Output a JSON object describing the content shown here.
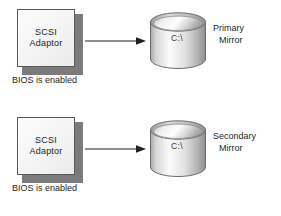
{
  "diagram": {
    "background_color": "#ffffff",
    "text_color": "#231f20",
    "groups": [
      {
        "id": "primary",
        "adaptor": {
          "line1": "SCSI",
          "line2": "Adaptor",
          "caption": "BIOS is enabled",
          "fill_color": "#f4f4f4",
          "border_color": "#59595b",
          "shadow_color": "#7b7b7b"
        },
        "arrow": {
          "direction": "right",
          "color": "#231f20"
        },
        "disk": {
          "label": "C:\\",
          "fill_light": "#fdfdfd",
          "fill_dark": "#9a9a9a",
          "outline_color": "#6b6b6b"
        },
        "mirror_label": {
          "line1": "Primary",
          "line2": "Mirror"
        }
      },
      {
        "id": "secondary",
        "adaptor": {
          "line1": "SCSI",
          "line2": "Adaptor",
          "caption": "BIOS is enabled",
          "fill_color": "#f4f4f4",
          "border_color": "#59595b",
          "shadow_color": "#7b7b7b"
        },
        "arrow": {
          "direction": "right",
          "color": "#231f20"
        },
        "disk": {
          "label": "C:\\",
          "fill_light": "#fdfdfd",
          "fill_dark": "#9a9a9a",
          "outline_color": "#6b6b6b"
        },
        "mirror_label": {
          "line1": "Secondary",
          "line2": "Mirror"
        }
      }
    ]
  }
}
